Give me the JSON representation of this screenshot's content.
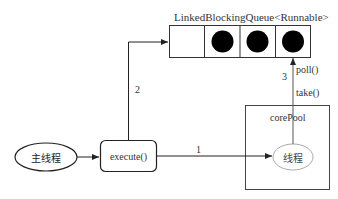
{
  "diagram": {
    "type": "thread-pool-flow",
    "queue": {
      "title": "LinkedBlockingQueue<Runnable>",
      "cells": [
        {
          "filled": false
        },
        {
          "filled": true
        },
        {
          "filled": true
        },
        {
          "filled": true
        }
      ]
    },
    "nodes": {
      "main_thread": {
        "label": "主线程"
      },
      "execute": {
        "label": "execute()"
      },
      "core_pool": {
        "label": "corePool"
      },
      "worker_thread": {
        "label": "线程"
      }
    },
    "edges": [
      {
        "id": "1",
        "from": "execute()",
        "to": "线程",
        "label": "1"
      },
      {
        "id": "2",
        "from": "execute()",
        "to": "LinkedBlockingQueue<Runnable>",
        "label": "2"
      },
      {
        "id": "3",
        "from": "线程",
        "to": "LinkedBlockingQueue<Runnable>",
        "label": "3",
        "annotations": [
          "poll()",
          "take()"
        ]
      }
    ],
    "edge_labels": {
      "e1": "1",
      "e2": "2",
      "e3": "3",
      "poll": "poll()",
      "take": "take()"
    },
    "colors": {
      "line": "#333333",
      "filled_cell": "#000000",
      "worker_ellipse_border": "#aaaaaa"
    }
  }
}
